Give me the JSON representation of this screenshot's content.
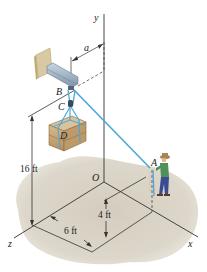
{
  "diagram": {
    "axes": {
      "x": "x",
      "y": "y",
      "z": "z",
      "origin": "O"
    },
    "points": {
      "A": "A",
      "B": "B",
      "C": "C",
      "D": "D"
    },
    "dimensions": {
      "a": "a",
      "height_B": "16 ft",
      "offset_x": "6 ft",
      "height_A": "4 ft"
    },
    "colors": {
      "cable": "#4aa8d8",
      "ground": "#d8d2c6",
      "crate": "#c9a877",
      "beam": "#9fb3c4",
      "wall_plate": "#d9c9a3",
      "axis": "#333333"
    }
  }
}
